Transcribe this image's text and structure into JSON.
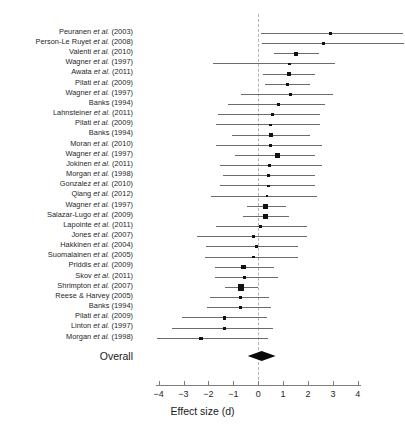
{
  "figure": {
    "type": "forest-plot",
    "axis_title": "Effect size (d)",
    "overall_label": "Overall"
  },
  "axis": {
    "min": -4,
    "max": 4,
    "ticks": [
      -4,
      -3,
      -2,
      -1,
      0,
      1,
      2,
      3,
      4
    ],
    "tick_labels": [
      "−4",
      "−3",
      "−2",
      "−1",
      "0",
      "1",
      "2",
      "3",
      "4"
    ],
    "zero_reference": 0
  },
  "chart_data": {
    "type": "forest",
    "title": "",
    "xlabel": "Effect size (d)",
    "ylabel": "",
    "xlim": [
      -4,
      4
    ],
    "grid": false,
    "legend": "none",
    "zero_line": 0,
    "studies": [
      {
        "label_plain": "Peuranen et al. (2003)",
        "author": "Peuranen",
        "italic": "et al.",
        "year": "(2003)",
        "effect": 2.9,
        "ci_low": 0.1,
        "ci_high": 5.8,
        "weight": 0.9
      },
      {
        "label_plain": "Person-Le Ruyet et al. (2008)",
        "author": "Person-Le Ruyet",
        "italic": "et al.",
        "year": "(2008)",
        "effect": 2.62,
        "ci_low": 0.14,
        "ci_high": 5.9,
        "weight": 0.9
      },
      {
        "label_plain": "Valenti et al. (2010)",
        "author": "Valenti",
        "italic": "et al.",
        "year": "(2010)",
        "effect": 1.52,
        "ci_low": 0.62,
        "ci_high": 2.46,
        "weight": 2.6
      },
      {
        "label_plain": "Wagner et al. (1997)",
        "author": "Wagner",
        "italic": "et al.",
        "year": "(1997)",
        "effect": 1.25,
        "ci_low": -1.8,
        "ci_high": 3.1,
        "weight": 1.2
      },
      {
        "label_plain": "Awata et al. (2011)",
        "author": "Awata",
        "italic": "et al.",
        "year": "(2011)",
        "effect": 1.23,
        "ci_low": 0.2,
        "ci_high": 2.3,
        "weight": 2.6
      },
      {
        "label_plain": "Pilati et al. (2009)",
        "author": "Pilati",
        "italic": "et al.",
        "year": "(2009)",
        "effect": 1.18,
        "ci_low": 0.26,
        "ci_high": 2.08,
        "weight": 1.8
      },
      {
        "label_plain": "Wagner et al. (1997)",
        "author": "Wagner",
        "italic": "et al.",
        "year": "(1997)",
        "effect": 1.3,
        "ci_low": -0.7,
        "ci_high": 3.0,
        "weight": 1.4
      },
      {
        "label_plain": "Banks (1994)",
        "author": "Banks",
        "italic": "",
        "year": "(1994)",
        "effect": 0.8,
        "ci_low": -1.2,
        "ci_high": 2.7,
        "weight": 1.2
      },
      {
        "label_plain": "Lahnsteiner et al. (2011)",
        "author": "Lahnsteiner",
        "italic": "et al.",
        "year": "(2011)",
        "effect": 0.58,
        "ci_low": -1.6,
        "ci_high": 2.5,
        "weight": 1.3
      },
      {
        "label_plain": "Pilati et al. (2009)",
        "author": "Pilati",
        "italic": "et al.",
        "year": "(2009)",
        "effect": 0.5,
        "ci_low": -1.7,
        "ci_high": 2.48,
        "weight": 1.1
      },
      {
        "label_plain": "Banks (1994)",
        "author": "Banks",
        "italic": "",
        "year": "(1994)",
        "effect": 0.52,
        "ci_low": -1.05,
        "ci_high": 2.1,
        "weight": 2.4
      },
      {
        "label_plain": "Moran et al. (2010)",
        "author": "Moran",
        "italic": "et al.",
        "year": "(2010)",
        "effect": 0.48,
        "ci_low": -1.7,
        "ci_high": 2.55,
        "weight": 1.2
      },
      {
        "label_plain": "Wagner et al. (1997)",
        "author": "Wagner",
        "italic": "et al.",
        "year": "(1997)",
        "effect": 0.78,
        "ci_low": -0.95,
        "ci_high": 2.3,
        "weight": 3.0
      },
      {
        "label_plain": "Jokinen et al. (2011)",
        "author": "Jokinen",
        "italic": "et al.",
        "year": "(2011)",
        "effect": 0.45,
        "ci_low": -1.55,
        "ci_high": 2.55,
        "weight": 1.1
      },
      {
        "label_plain": "Morgan et al. (1998)",
        "author": "Morgan",
        "italic": "et al.",
        "year": "(1998)",
        "effect": 0.42,
        "ci_low": -1.42,
        "ci_high": 2.3,
        "weight": 1.0
      },
      {
        "label_plain": "Gonzalez et al. (2010)",
        "author": "Gonzalez",
        "italic": "et al.",
        "year": "(2010)",
        "effect": 0.4,
        "ci_low": -1.55,
        "ci_high": 2.3,
        "weight": 1.0
      },
      {
        "label_plain": "Qiang et al. (2012)",
        "author": "Qiang",
        "italic": "et al.",
        "year": "(2012)",
        "effect": 0.35,
        "ci_low": -1.9,
        "ci_high": 2.35,
        "weight": 0.9
      },
      {
        "label_plain": "Wagner et al. (1997)",
        "author": "Wagner",
        "italic": "et al.",
        "year": "(1997)",
        "effect": 0.3,
        "ci_low": -0.45,
        "ci_high": 1.1,
        "weight": 3.3
      },
      {
        "label_plain": "Salazar-Lugo et al. (2009)",
        "author": "Salazar-Lugo",
        "italic": "et al.",
        "year": "(2009)",
        "effect": 0.28,
        "ci_low": -0.62,
        "ci_high": 1.22,
        "weight": 3.1
      },
      {
        "label_plain": "Lapointe et al. (2011)",
        "author": "Lapointe",
        "italic": "et al.",
        "year": "(2011)",
        "effect": 0.1,
        "ci_low": -1.7,
        "ci_high": 1.95,
        "weight": 1.4
      },
      {
        "label_plain": "Jones et al. (2007)",
        "author": "Jones",
        "italic": "et al.",
        "year": "(2007)",
        "effect": -0.2,
        "ci_low": -2.45,
        "ci_high": 1.95,
        "weight": 1.0
      },
      {
        "label_plain": "Hakkinen et al. (2004)",
        "author": "Hakkinen",
        "italic": "et al.",
        "year": "(2004)",
        "effect": -0.05,
        "ci_low": -2.1,
        "ci_high": 1.6,
        "weight": 1.2
      },
      {
        "label_plain": "Suomalainen et al. (2005)",
        "author": "Suomalainen",
        "italic": "et al.",
        "year": "(2005)",
        "effect": -0.2,
        "ci_low": -2.15,
        "ci_high": 1.6,
        "weight": 1.1
      },
      {
        "label_plain": "Priddis et al. (2009)",
        "author": "Priddis",
        "italic": "et al.",
        "year": "(2009)",
        "effect": -0.58,
        "ci_low": -1.75,
        "ci_high": 0.65,
        "weight": 2.8
      },
      {
        "label_plain": "Skov et al. (2011)",
        "author": "Skov",
        "italic": "et al.",
        "year": "(2011)",
        "effect": -0.55,
        "ci_low": -1.75,
        "ci_high": 0.8,
        "weight": 1.7
      },
      {
        "label_plain": "Shrimpton et al. (2007)",
        "author": "Shrimpton",
        "italic": "et al.",
        "year": "(2007)",
        "effect": -0.7,
        "ci_low": -1.35,
        "ci_high": 0.0,
        "weight": 4.2
      },
      {
        "label_plain": "Reese & Harvey (2005)",
        "author": "Reese & Harvey",
        "italic": "",
        "year": "(2005)",
        "effect": -0.72,
        "ci_low": -1.95,
        "ci_high": 0.45,
        "weight": 1.6
      },
      {
        "label_plain": "Banks (1994)",
        "author": "Banks",
        "italic": "",
        "year": "(1994)",
        "effect": -0.7,
        "ci_low": -2.05,
        "ci_high": 0.5,
        "weight": 1.5
      },
      {
        "label_plain": "Pilati et al. (2009)",
        "author": "Pilati",
        "italic": "et al.",
        "year": "(2009)",
        "effect": -1.35,
        "ci_low": -3.05,
        "ci_high": 0.35,
        "weight": 1.5
      },
      {
        "label_plain": "Linton et al. (1997)",
        "author": "Linton",
        "italic": "et al.",
        "year": "(1997)",
        "effect": -1.35,
        "ci_low": -3.45,
        "ci_high": 0.6,
        "weight": 1.2
      },
      {
        "label_plain": "Morgan et al. (1998)",
        "author": "Morgan",
        "italic": "et al.",
        "year": "(1998)",
        "effect": -2.3,
        "ci_low": -4.05,
        "ci_high": 0.4,
        "weight": 1.4
      }
    ],
    "overall": {
      "label": "Overall",
      "effect": 0.14,
      "ci_low": -0.42,
      "ci_high": 0.7
    }
  }
}
